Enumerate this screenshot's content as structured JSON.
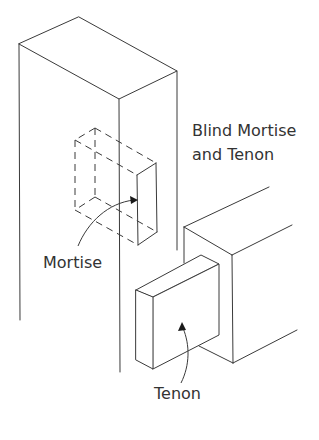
{
  "diagram": {
    "title_line1": "Blind Mortise",
    "title_line2": "and Tenon",
    "labels": {
      "mortise": "Mortise",
      "tenon": "Tenon"
    },
    "components": [
      {
        "name": "post",
        "description": "vertical timber post drawn in isometric view"
      },
      {
        "name": "mortise",
        "description": "hidden rectangular cavity in post, shown with dashed lines"
      },
      {
        "name": "rail",
        "description": "horizontal timber rail entering from the right"
      },
      {
        "name": "tenon",
        "description": "rectangular tongue projecting from the rail end"
      }
    ],
    "colors": {
      "line": "#3a3a3a",
      "text": "#333333",
      "background": "#ffffff"
    }
  }
}
